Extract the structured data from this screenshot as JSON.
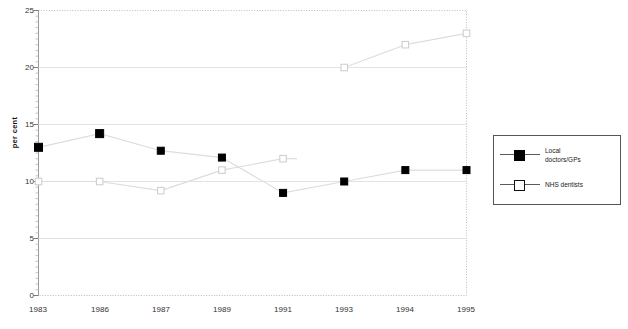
{
  "chart_data": {
    "type": "line",
    "title": "",
    "subtitle": "",
    "xlabel": "",
    "ylabel": "per cent",
    "categories": [
      "1983",
      "1986",
      "1987",
      "1989",
      "1991",
      "1993",
      "1994",
      "1995"
    ],
    "ylim": [
      0,
      25
    ],
    "yticks": [
      0,
      5,
      10,
      15,
      20,
      25
    ],
    "grid": "horizontal",
    "legend_position": "right",
    "series": [
      {
        "name": "Local doctors/GPs",
        "marker": "filled-square",
        "color": "#000000",
        "values": [
          13,
          14.2,
          12.7,
          12.1,
          9,
          10,
          11,
          11
        ]
      },
      {
        "name": "NHS dentists",
        "marker": "hollow-square",
        "color": "#ffffff",
        "values": [
          10,
          10,
          9.2,
          11,
          12,
          20,
          22,
          23
        ]
      }
    ]
  },
  "axes": {
    "y_title": "per cent",
    "y_tick_labels": [
      "25",
      "20",
      "15",
      "10",
      "5",
      "0"
    ],
    "x_tick_labels": [
      "1983",
      "1986",
      "1987",
      "1989",
      "1991",
      "1993",
      "1994",
      "1995"
    ]
  },
  "legend": {
    "entries": [
      {
        "label": "Local\ndoctors/GPs",
        "marker": "filled-square"
      },
      {
        "label": "NHS dentists",
        "marker": "hollow-square"
      }
    ]
  },
  "colors": {
    "series_1": "#000000",
    "series_2": "#ffffff",
    "gridline": "#e3e3e3",
    "line": "#dddddd",
    "axis": "#9a9a9a",
    "legend_border": "#555555"
  }
}
